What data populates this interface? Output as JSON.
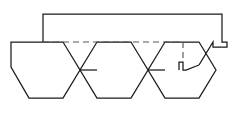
{
  "figure": {
    "title": "",
    "kind": "line-drawing",
    "description": "Three linked hexagonal rings with an enclosing bracket outline and a horizontal dashed reference line",
    "canvas": {
      "width": 236,
      "height": 113
    },
    "colors": {
      "background": "#ffffff",
      "solid_stroke": "#1a1a1a",
      "dashed_stroke": "#555555"
    },
    "stroke_widths": {
      "solid": 1.25,
      "dashed": 1.15
    }
  },
  "chart_data": {
    "type": "diagram-paths",
    "title": "",
    "xlabel": "",
    "ylabel": "",
    "axis_ranges": {
      "x": [
        0,
        236
      ],
      "y": [
        0,
        113
      ]
    },
    "grid": false,
    "legend": "none",
    "shapes": [
      {
        "name": "outer-bracket-outline",
        "style": "solid",
        "closed": false,
        "points": [
          [
            11,
            42
          ],
          [
            11,
            57
          ],
          [
            15,
            57
          ],
          [
            15,
            62
          ],
          [
            11,
            62
          ],
          [
            11,
            67
          ],
          [
            29,
            98
          ],
          [
            63,
            98
          ],
          [
            80,
            70
          ],
          [
            63,
            42
          ],
          [
            43,
            42
          ],
          [
            43,
            14
          ],
          [
            222,
            14
          ],
          [
            222,
            42
          ],
          [
            227,
            42
          ],
          [
            227,
            47
          ],
          [
            213,
            47
          ],
          [
            213,
            42
          ],
          [
            196,
            70
          ],
          [
            183,
            70
          ],
          [
            183,
            62
          ],
          [
            179,
            62
          ],
          [
            179,
            70
          ]
        ]
      },
      {
        "name": "hexagon-ring-left",
        "style": "solid",
        "closed": true,
        "points": [
          [
            11,
            42
          ],
          [
            43,
            42
          ],
          [
            63,
            42
          ],
          [
            80,
            70
          ],
          [
            63,
            98
          ],
          [
            29,
            98
          ],
          [
            11,
            67
          ],
          [
            11,
            42
          ]
        ]
      },
      {
        "name": "hexagon-ring-center",
        "style": "solid",
        "closed": true,
        "points": [
          [
            97,
            42
          ],
          [
            131,
            42
          ],
          [
            148,
            70
          ],
          [
            131,
            98
          ],
          [
            97,
            98
          ],
          [
            80,
            70
          ]
        ]
      },
      {
        "name": "hexagon-ring-right",
        "style": "solid",
        "closed": true,
        "points": [
          [
            165,
            42
          ],
          [
            199,
            42
          ],
          [
            216,
            70
          ],
          [
            199,
            98
          ],
          [
            165,
            98
          ],
          [
            148,
            70
          ]
        ]
      },
      {
        "name": "bond-left-to-center",
        "style": "solid",
        "points": [
          [
            80,
            70
          ],
          [
            97,
            70
          ]
        ]
      },
      {
        "name": "bond-center-to-right",
        "style": "solid",
        "points": [
          [
            148,
            70
          ],
          [
            165,
            70
          ]
        ]
      },
      {
        "name": "dashed-reference-line",
        "style": "dashed",
        "points": [
          [
            43,
            42
          ],
          [
            183,
            42
          ]
        ]
      },
      {
        "name": "dashed-drop-line",
        "style": "dashed",
        "points": [
          [
            183,
            42
          ],
          [
            183,
            62
          ]
        ]
      }
    ]
  },
  "annotations": {
    "labels": []
  }
}
